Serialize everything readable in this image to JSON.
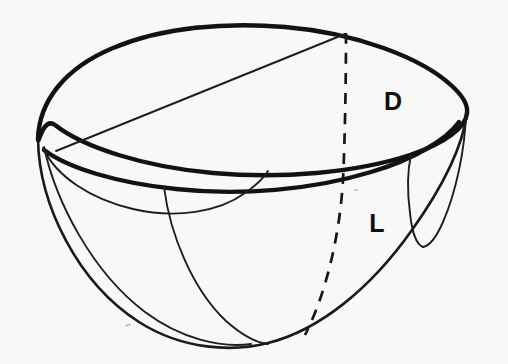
{
  "figure": {
    "kind": "technical-line-drawing",
    "background_color": "#f8f8f7",
    "ink_color": "#121212",
    "width": 508,
    "height": 364
  },
  "labels": {
    "diameter": {
      "text": "D",
      "meaning": "diameter of bowl rim",
      "x": 393,
      "y": 103
    },
    "length": {
      "text": "L",
      "meaning": "depth / length of bowl",
      "x": 377,
      "y": 225
    }
  },
  "geometry": {
    "rim_ellipse": {
      "center_x": 252,
      "center_y": 103,
      "radius_x": 215,
      "radius_y": 70,
      "description": "top rim of the bowl drawn as an ellipse in perspective"
    },
    "outer_bowl": {
      "description": "lower hemispherical silhouette from left rim to right rim",
      "left_x": 38,
      "right_x": 467,
      "bottom_y": 343
    },
    "dashed_meridian": {
      "description": "hidden centre meridian from rim top to bowl bottom",
      "start_x": 346,
      "start_y": 33,
      "end_x": 300,
      "end_y": 340
    },
    "chord_line": {
      "description": "straight diameter chord across the rim opening",
      "start_x": 57,
      "start_y": 151,
      "end_x": 345,
      "end_y": 34
    },
    "inner_rim_arc": {
      "description": "thick front inner edge of the rim wall"
    },
    "left_lens": {
      "description": "small lens shape at the left rim formed by two arcs"
    },
    "right_lens": {
      "description": "narrow teardrop cut at the right rim"
    },
    "inner_meridian": {
      "description": "front meridian arc from left rim sweeping to bowl bottom"
    }
  }
}
